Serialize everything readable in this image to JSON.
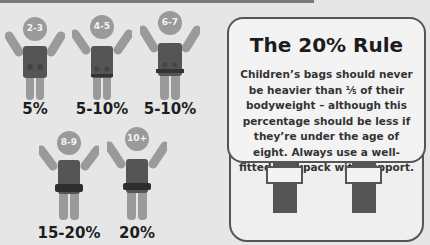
{
  "figures": [
    {
      "age": "2-3",
      "percent": "5%"
    },
    {
      "age": "4-5",
      "percent": "5-10%"
    },
    {
      "age": "6-7",
      "percent": "5-10%"
    },
    {
      "age": "8-9",
      "percent": "15-20%"
    },
    {
      "age": "10+",
      "percent": "20%"
    }
  ],
  "card": {
    "title": "The 20% Rule",
    "body": "Children’s bags should never be heavier than ⅕ of their bodyweight – although this percentage should be less if they’re under the age of eight. Always use a well-fitted backpack with support."
  },
  "colors": {
    "background": "#e6e6e6",
    "figure": "#9a9a9a",
    "backpack": "#4d4d4d",
    "text": "#1e1e1e"
  }
}
